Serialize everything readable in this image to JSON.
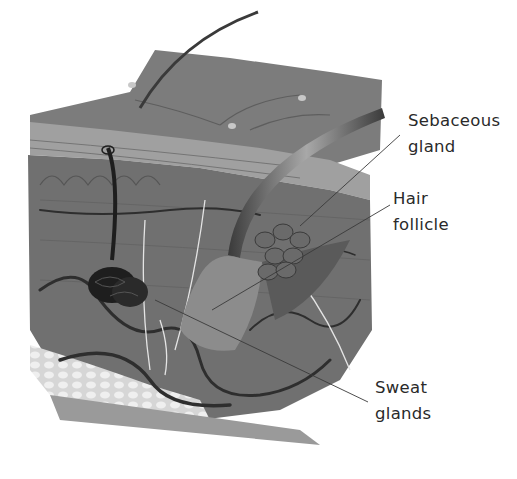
{
  "diagram": {
    "style": "grayscale illustration",
    "colors": {
      "background": "#ffffff",
      "skin_surface": "#7a7a7a",
      "epidermis": "#9a9a9a",
      "dermis": "#6e6e6e",
      "fat_layer": "#d8d8d8",
      "vessels": "#2e2e2e",
      "nerves": "#e6e6e6",
      "label_text": "#2a2a2a",
      "leader_line": "#3a3a3a"
    },
    "labels": [
      {
        "id": "sebaceous-gland",
        "line1": "Sebaceous",
        "line2": "gland"
      },
      {
        "id": "hair-follicle",
        "line1": "Hair",
        "line2": "follicle"
      },
      {
        "id": "sweat-glands",
        "line1": "Sweat",
        "line2": "glands"
      }
    ]
  }
}
